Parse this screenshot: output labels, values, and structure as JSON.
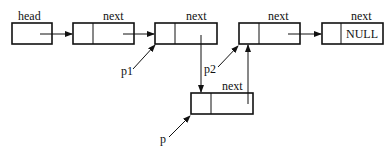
{
  "diagram": {
    "type": "linked-list-insertion",
    "nodes": [
      {
        "id": "head",
        "label": "head",
        "content": ""
      },
      {
        "id": "n1",
        "label": "next",
        "content": ""
      },
      {
        "id": "n2",
        "label": "next",
        "content": ""
      },
      {
        "id": "n3",
        "label": "next",
        "content": ""
      },
      {
        "id": "n4",
        "label": "next",
        "content": "NULL"
      },
      {
        "id": "newnode",
        "label": "next",
        "content": ""
      }
    ],
    "pointers": [
      {
        "label": "p1",
        "target": "n2"
      },
      {
        "label": "p2",
        "target": "n3"
      },
      {
        "label": "p",
        "target": "newnode"
      }
    ],
    "edges": [
      {
        "from": "head",
        "to": "n1"
      },
      {
        "from": "n1",
        "to": "n2"
      },
      {
        "from": "n2",
        "to": "newnode"
      },
      {
        "from": "newnode",
        "to": "n3"
      },
      {
        "from": "n3",
        "to": "n4"
      }
    ]
  }
}
